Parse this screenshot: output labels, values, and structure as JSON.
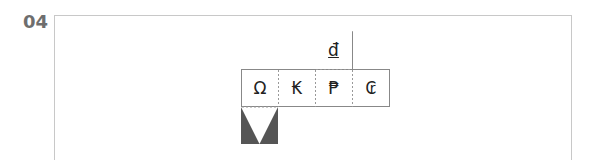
{
  "question_number": "04",
  "net": {
    "top_face": {
      "symbol": "đ",
      "underline": true
    },
    "row": [
      {
        "symbol": "Ω"
      },
      {
        "symbol": "₭"
      },
      {
        "symbol": "₱"
      },
      {
        "symbol": "₢"
      }
    ],
    "bottom_face": {
      "pattern": "dark-fill-with-white-inverted-triangle",
      "fill_color": "#555555"
    }
  },
  "colors": {
    "line": "#888888",
    "dash": "#999999",
    "frame": "#c8c8c8",
    "number": "#6e6e6e"
  }
}
